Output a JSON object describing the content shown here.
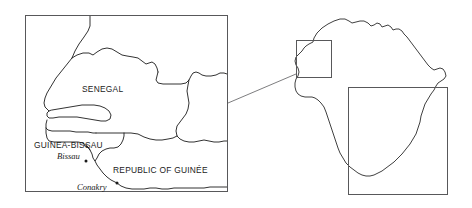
{
  "figure": {
    "kind": "locator-map",
    "background_color": "#ffffff",
    "line_color": "#1c1c1c",
    "frame_color": "#58585a",
    "leader_color": "#6e6e70"
  },
  "main_map": {
    "name": "west-africa-detail-map",
    "frame": {
      "x": 25,
      "y": 15,
      "width": 203,
      "height": 177
    },
    "country_labels": [
      {
        "id": "senegal",
        "text": "SENEGAL",
        "x": 82,
        "y": 92
      },
      {
        "id": "guinea-bissau",
        "text": "GUINEA-BISSAU",
        "x": 34,
        "y": 148
      },
      {
        "id": "republic-of-guinee",
        "text": "REPUBLIC OF GUINÉE",
        "x": 113,
        "y": 173
      }
    ],
    "city_labels": [
      {
        "id": "bissau",
        "text": "Bissau",
        "x": 57,
        "y": 159,
        "dot_x": 86,
        "dot_y": 161
      },
      {
        "id": "conakry",
        "text": "Conakry",
        "x": 77,
        "y": 190,
        "dot_x": 117,
        "dot_y": 183
      }
    ]
  },
  "inset_map": {
    "name": "africa-inset-map",
    "highlight_box": {
      "x": 296,
      "y": 40,
      "width": 36,
      "height": 38
    },
    "crop_rectangle": {
      "x": 348,
      "y": 87,
      "width": 100,
      "height": 108
    },
    "leader_line": {
      "x1": 228,
      "y1": 103,
      "x2": 296,
      "y2": 74
    }
  }
}
